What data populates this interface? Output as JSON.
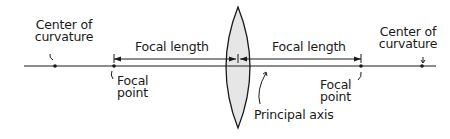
{
  "diagram": {
    "labels": {
      "center_of_curvature_left": [
        "Center of",
        "curvature"
      ],
      "center_of_curvature_right": [
        "Center of",
        "curvature"
      ],
      "focal_length_left": "Focal length",
      "focal_length_right": "Focal length",
      "focal_point_left": [
        "Focal",
        "point"
      ],
      "focal_point_right": [
        "Focal",
        "point"
      ],
      "principal_axis": "Principal axis"
    },
    "colors": {
      "line": "#1a1a1a",
      "lens_fill": "#e6e6e6",
      "background": "#ffffff"
    },
    "geometry": {
      "axis_y": 66,
      "axis_x_start": 24,
      "axis_x_end": 436,
      "lens_center_x": 238,
      "lens_top_y": 7,
      "lens_bottom_y": 128,
      "focal_point_left_x": 114,
      "focal_point_right_x": 361,
      "center_of_curvature_left_x": 55,
      "center_of_curvature_right_x": 422,
      "focal_length_arrow_y": 59
    }
  }
}
